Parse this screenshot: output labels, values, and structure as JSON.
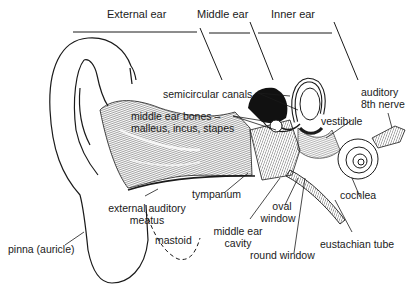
{
  "diagram": {
    "sections": {
      "external": "External ear",
      "middle": "Middle ear",
      "inner": "Inner ear"
    },
    "labels": {
      "semicircular_canals": "semicircular canals",
      "middle_ear_bones_1": "middle ear bones –",
      "middle_ear_bones_2": "malleus, incus, stapes",
      "auditory_nerve_1": "auditory",
      "auditory_nerve_2": "8th nerve",
      "vestibule": "vestibule",
      "tympanum": "tympanum",
      "cochlea": "cochlea",
      "external_meatus_1": "external auditory",
      "external_meatus_2": "meatus",
      "oval_window_1": "oval",
      "oval_window_2": "window",
      "middle_ear_cavity_1": "middle ear",
      "middle_ear_cavity_2": "cavity",
      "pinna": "pinna (auricle)",
      "mastoid": "mastoid",
      "round_window": "round window",
      "eustachian_tube": "eustachian tube"
    },
    "colors": {
      "ink": "#1a1a1a",
      "background": "#ffffff",
      "hatch": "#555555"
    }
  }
}
